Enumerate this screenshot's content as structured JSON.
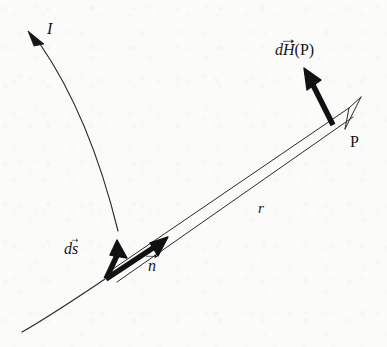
{
  "figure": {
    "kind": "physics-vector-diagram",
    "width": 387,
    "height": 347,
    "background_color": "#fbfbfa",
    "ink_color": "#151515"
  },
  "labels": {
    "current": {
      "text": "I",
      "meaning": "current-label"
    },
    "field_element": {
      "symbol": "dH",
      "d": "d",
      "h": "H",
      "argument": "(P)",
      "meaning": "differential-magnetic-field-at-P"
    },
    "point": {
      "text": "P",
      "meaning": "field-point-label"
    },
    "distance": {
      "text": "r",
      "meaning": "distance-from-source-to-field-point"
    },
    "source_element": {
      "d": "d",
      "s": "s",
      "meaning": "differential-current-element-vector"
    },
    "unit_normal": {
      "text": "n",
      "meaning": "unit-vector-from-source-toward-P"
    }
  },
  "geometry": {
    "wire_upper_arc": "M 118 231 C 106 182 84 108 40 44",
    "wire_lower_arc": "M 105 279 C 78 297 50 316 22 332",
    "current_arrowhead": "M 28 31 L 44 44 L 34 46 Z",
    "r_line_upper": "M 110 271 L 349 108",
    "r_line_lower": "M 117 282 L 353 117",
    "r_arrowhead_upper": "M 349 108 L 361 97",
    "r_arrowhead_lower": "M 349 108 L 345 129",
    "ds_shaft": "M 106 279 L 120 249",
    "ds_arrowhead": "M 117 240 L 127 258 L 110 255 Z",
    "n_shaft": "M 106 279 L 159 244",
    "n_arrowhead": "M 168 237 L 150 243 L 158 256 Z",
    "dh_shaft": "M 333 125 L 311 81",
    "dh_arrowhead": "M 304 68 L 307 90 L 321 80 Z",
    "p_vertex": "333 125",
    "source_vertex": "106 279"
  },
  "styles": {
    "thin_stroke_width": 1.1,
    "thick_stroke_width": 5.2,
    "r_stroke_width": 1.0
  }
}
